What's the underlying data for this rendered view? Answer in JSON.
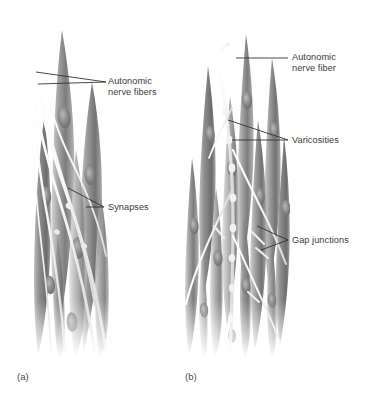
{
  "figure": {
    "type": "anatomical-diagram",
    "background_color": "#ffffff",
    "panels": [
      {
        "id": "a",
        "letter": "(a)",
        "description": "Multi-unit smooth muscle with autonomic nerve fibers forming synapses"
      },
      {
        "id": "b",
        "letter": "(b)",
        "description": "Single-unit smooth muscle with varicosities and gap junctions"
      }
    ]
  },
  "labels": {
    "autonomic_nerve_fibers": {
      "line1": "Autonomic",
      "line2": "nerve fibers"
    },
    "synapses": {
      "line1": "Synapses"
    },
    "autonomic_nerve_fiber": {
      "line1": "Autonomic",
      "line2": "nerve fiber"
    },
    "varicosities": {
      "line1": "Varicosities"
    },
    "gap_junctions": {
      "line1": "Gap junctions"
    }
  },
  "colors": {
    "text": "#3a3a3a",
    "leader_line": "#2b2b2b",
    "muscle_mid": "#9a9a9a",
    "muscle_dark": "#656565",
    "muscle_light": "#dcdcdc",
    "nerve_fiber": "#f4f4f4",
    "nucleus": "#8a8a8a",
    "background": "#ffffff"
  }
}
